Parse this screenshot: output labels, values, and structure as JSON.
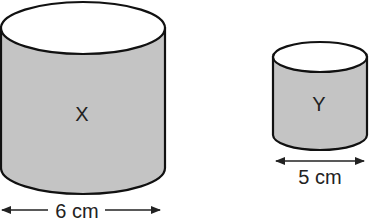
{
  "diagram": {
    "cylinders": [
      {
        "id": "X",
        "label": "X",
        "diameter_label": "6 cm",
        "diameter_cm": 6
      },
      {
        "id": "Y",
        "label": "Y",
        "diameter_label": "5 cm",
        "diameter_cm": 5
      }
    ],
    "colors": {
      "body_fill": "#c4c4c4",
      "top_fill": "#ffffff",
      "stroke": "#111111",
      "text": "#222222"
    }
  }
}
